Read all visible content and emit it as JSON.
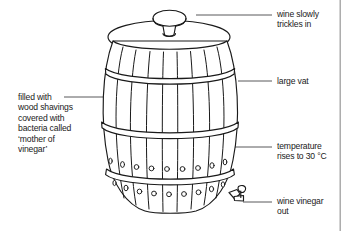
{
  "figure": {
    "background_color": "#ffffff",
    "ink_color": "#1a1a1a",
    "leader_line_color": "#58585a"
  },
  "labels": {
    "wine_in": "wine slowly\ntrickles in",
    "large_vat": "large vat",
    "temperature": "temperature\nrises to 30 °C",
    "vinegar_out": "wine vinegar\nout",
    "filled_with": "filled with\nwood shavings\ncovered with\nbacteria called\n‘mother of\nvinegar’"
  },
  "parts": {
    "funnel": "funnel-top",
    "lid": "vat-lid",
    "body": "vat-body-staves",
    "hoops": "vat-hoops",
    "vent_holes_top_row": 9,
    "vent_holes_bottom_row": 9,
    "tap": "spigot-tap"
  }
}
